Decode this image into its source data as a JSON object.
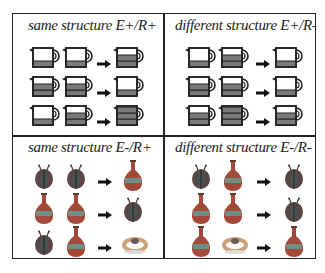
{
  "panels": [
    {
      "id": "top-left",
      "title": "same structure  E+/R+",
      "kind": "cups",
      "rows": [
        {
          "inputs": [
            1,
            1
          ],
          "result": 2
        },
        {
          "inputs": [
            2,
            2
          ],
          "result": 1
        },
        {
          "inputs": [
            1,
            2
          ],
          "result": 3
        }
      ]
    },
    {
      "id": "top-right",
      "title": "different structure E+/R-",
      "kind": "cups",
      "rows": [
        {
          "inputs": [
            1,
            2
          ],
          "result": 1
        },
        {
          "inputs": [
            2,
            2
          ],
          "result": 1
        },
        {
          "inputs": [
            2,
            3
          ],
          "result": 2
        }
      ]
    },
    {
      "id": "bottom-left",
      "title": "same structure  E-/R+",
      "kind": "objects",
      "rows": [
        {
          "inputs": [
            "ladybug",
            "ladybug"
          ],
          "result": "vase"
        },
        {
          "inputs": [
            "vase",
            "vase"
          ],
          "result": "ladybug"
        },
        {
          "inputs": [
            "ladybug",
            "vase"
          ],
          "result": "ring"
        }
      ]
    },
    {
      "id": "bottom-right",
      "title": "different structure E-/R-",
      "kind": "objects",
      "rows": [
        {
          "inputs": [
            "ladybug",
            "vase"
          ],
          "result": "ladybug"
        },
        {
          "inputs": [
            "vase",
            "vase"
          ],
          "result": "ladybug"
        },
        {
          "inputs": [
            "vase",
            "ring"
          ],
          "result": "vase"
        }
      ]
    }
  ],
  "arrow_icon": "right-arrow-icon",
  "colors": {
    "line": "#222222",
    "cup_fill": "#7a7a7a",
    "vase_body": "#a4493a",
    "vase_band": "#6f8e86",
    "ladybug": "#4a3a3a",
    "ring": "#c9a27a"
  }
}
